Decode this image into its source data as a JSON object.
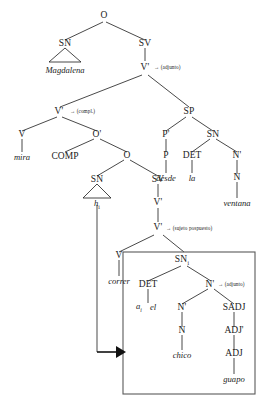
{
  "diagram": {
    "type": "x-bar-syntax-tree",
    "language": "Spanish",
    "ink_color": "#1b1b1b",
    "box_color": "#5a5a5a",
    "nodes": {
      "o_root": "O",
      "sn_subject": "SN",
      "sv_top": "SV",
      "vbar_adjunct": "V'",
      "vbar_compl": "V'",
      "v_mira": "V",
      "obar": "O'",
      "comp": "COMP",
      "o_embedded": "O",
      "sn_trace": "SN",
      "sv_embedded": "SV",
      "vbar_star": "V'",
      "v_star": "V'",
      "v_correr": "V",
      "sp": "SP",
      "pbar": "P'",
      "p": "P",
      "sn_right": "SN",
      "det_la": "DET",
      "nbar_right": "N'",
      "n_ventana": "N",
      "sn_boxed": "SN",
      "det_boxed": "DET",
      "nbar_boxed": "N'",
      "nbar_inner": "N'",
      "n_chico": "N",
      "sadj": "SADJ",
      "adjbar": "ADJ'",
      "adj": "ADJ"
    },
    "subscripts": {
      "sn_trace_word": "i",
      "sn_boxed": "i",
      "det_boxed_word": "i"
    },
    "words": {
      "magdalena": "Magdalena",
      "mira": "mira",
      "trace": "h",
      "correr": "correr",
      "desde": "desde",
      "la": "la",
      "ventana": "ventana",
      "det_a": "a",
      "det_el": "el",
      "chico": "chico",
      "guapo": "guapo"
    },
    "annotations": {
      "adjunto_top": "→ (adjunto)",
      "compl": "→ (compl.)",
      "sujeto_pospuesto": "→ (sujeto pospuesto)",
      "adjunto_boxed": "→ (adjunto)"
    }
  }
}
